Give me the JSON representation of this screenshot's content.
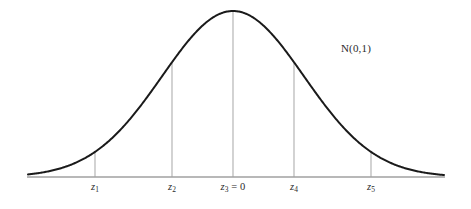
{
  "figure": {
    "background_color": "#ffffff",
    "width": 471,
    "height": 209,
    "annotation": {
      "text": "N(0,1)",
      "x": 356,
      "y": 42
    }
  },
  "axis": {
    "color": "#a0a0a0",
    "y": 177,
    "x_start": 27,
    "x_end": 445,
    "thickness": 1.6
  },
  "curve": {
    "color": "#1a1a1a",
    "thickness": 2.0,
    "peak_x": 233,
    "peak_y": 11,
    "sigma_px": 71,
    "x_left": 28,
    "x_right": 444
  },
  "gridlines": {
    "color": "#b5b5b5",
    "thickness": 1.2
  },
  "ticks": [
    {
      "id": "z1",
      "label_main": "z",
      "label_sub": "1",
      "label_suffix": "",
      "x": 95,
      "label_y": 181,
      "z_value": -1.95
    },
    {
      "id": "z2",
      "label_main": "z",
      "label_sub": "2",
      "label_suffix": "",
      "x": 172,
      "label_y": 181,
      "z_value": -0.86
    },
    {
      "id": "z3",
      "label_main": "z",
      "label_sub": "3",
      "label_suffix": " = 0",
      "x": 233,
      "label_y": 181,
      "z_value": 0
    },
    {
      "id": "z4",
      "label_main": "z",
      "label_sub": "4",
      "label_suffix": "",
      "x": 294,
      "label_y": 181,
      "z_value": 0.86
    },
    {
      "id": "z5",
      "label_main": "z",
      "label_sub": "5",
      "label_suffix": "",
      "x": 371,
      "label_y": 181,
      "z_value": 1.95
    }
  ],
  "chart_data": {
    "type": "line",
    "title": "",
    "subtitle": "",
    "xlabel": "",
    "ylabel": "",
    "grid": false,
    "legend_position": "none",
    "annotations": [
      {
        "text": "N(0,1)",
        "x_px": 356,
        "y_px": 42
      }
    ],
    "distribution": {
      "name": "N(0,1)",
      "family": "normal",
      "mean": 0,
      "variance": 1,
      "std_dev": 1
    },
    "x_tick_labels": [
      "z₁",
      "z₂",
      "z₃ = 0",
      "z₄",
      "z₅"
    ],
    "x_tick_pixels": [
      95,
      172,
      233,
      294,
      371
    ],
    "x_tick_z_values": [
      -1.95,
      -0.86,
      0,
      0.86,
      1.95
    ],
    "y_tick_labels": [],
    "xlim_z": [
      -2.9,
      2.97
    ],
    "ylim_density": [
      0,
      0.3989
    ],
    "series": [
      {
        "name": "standard normal pdf",
        "x": [
          -3.0,
          -2.75,
          -2.5,
          -2.25,
          -2.0,
          -1.95,
          -1.75,
          -1.5,
          -1.25,
          -1.0,
          -0.86,
          -0.75,
          -0.5,
          -0.25,
          0.0,
          0.25,
          0.5,
          0.75,
          0.86,
          1.0,
          1.25,
          1.5,
          1.75,
          1.95,
          2.0,
          2.25,
          2.5,
          2.75,
          3.0
        ],
        "y": [
          0.0044,
          0.0091,
          0.0175,
          0.0317,
          0.054,
          0.0596,
          0.0863,
          0.1295,
          0.1826,
          0.242,
          0.2756,
          0.3011,
          0.3521,
          0.3867,
          0.3989,
          0.3867,
          0.3521,
          0.3011,
          0.2756,
          0.242,
          0.1826,
          0.1295,
          0.0863,
          0.0596,
          0.054,
          0.0317,
          0.0175,
          0.0091,
          0.0044
        ]
      }
    ]
  }
}
